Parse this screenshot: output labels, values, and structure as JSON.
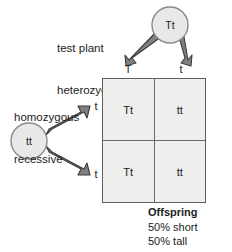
{
  "diagram": {
    "type": "punnett-square",
    "title_annotations": {
      "top_parent": [
        "test plant",
        "heterozygous tall"
      ],
      "left_parent": [
        "homozygous",
        "recessive"
      ]
    },
    "parents": {
      "top": {
        "genotype": "Tt",
        "gametes": [
          "T",
          "t"
        ]
      },
      "left": {
        "genotype": "tt",
        "gametes": [
          "t",
          "t"
        ]
      }
    },
    "grid": {
      "column_labels": [
        "T",
        "t"
      ],
      "row_labels": [
        "t",
        "t"
      ],
      "cells": [
        [
          "Tt",
          "tt"
        ],
        [
          "Tt",
          "tt"
        ]
      ]
    },
    "offspring": {
      "heading": "Offspring",
      "lines": [
        "50% short",
        "50% tall"
      ]
    },
    "colors": {
      "cell_fill": "#eeeeec",
      "grid_line": "#5e5e5e",
      "arrow_fill": "#808080",
      "arrow_stroke": "#3c3c3c",
      "circle_fill": "#e8e8e6",
      "circle_stroke": "#7a7a7a",
      "text": "#1b1b1b",
      "background": "#ffffff"
    }
  }
}
